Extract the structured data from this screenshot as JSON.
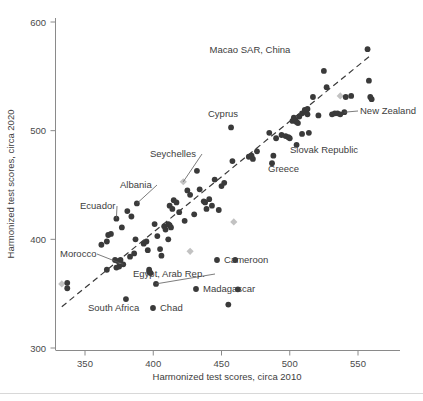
{
  "chart_data": {
    "type": "scatter",
    "title": "",
    "xlabel": "Harmonized test scores, circa 2010",
    "ylabel": "Harmonized test scores, circa 2020",
    "xlim": [
      325,
      570
    ],
    "ylim": [
      295,
      595
    ],
    "xticks": [
      350,
      400,
      450,
      500,
      550
    ],
    "yticks": [
      300,
      400,
      500,
      600
    ],
    "grid": false,
    "legend": "none",
    "trendline": {
      "type": "dashed-reference-line",
      "x": [
        333,
        560
      ],
      "y": [
        338,
        570
      ]
    },
    "series": [
      {
        "name": "Countries (highlighted dark)",
        "marker": "circle",
        "color": "#3a3a3a",
        "points": [
          {
            "x": 337,
            "y": 360
          },
          {
            "x": 337,
            "y": 355
          },
          {
            "x": 362,
            "y": 395
          },
          {
            "x": 366,
            "y": 398
          },
          {
            "x": 367,
            "y": 404
          },
          {
            "x": 369,
            "y": 405
          },
          {
            "x": 366,
            "y": 372
          },
          {
            "x": 372,
            "y": 381
          },
          {
            "x": 373,
            "y": 419
          },
          {
            "x": 374,
            "y": 380
          },
          {
            "x": 376,
            "y": 381
          },
          {
            "x": 375,
            "y": 375
          },
          {
            "x": 373,
            "y": 374
          },
          {
            "x": 377,
            "y": 411
          },
          {
            "x": 378,
            "y": 377
          },
          {
            "x": 380,
            "y": 345
          },
          {
            "x": 381,
            "y": 426
          },
          {
            "x": 383,
            "y": 384
          },
          {
            "x": 384,
            "y": 421
          },
          {
            "x": 386,
            "y": 387
          },
          {
            "x": 387,
            "y": 400
          },
          {
            "x": 388,
            "y": 433
          },
          {
            "x": 393,
            "y": 396
          },
          {
            "x": 395,
            "y": 398
          },
          {
            "x": 396,
            "y": 390
          },
          {
            "x": 397,
            "y": 372
          },
          {
            "x": 397,
            "y": 370
          },
          {
            "x": 398,
            "y": 369
          },
          {
            "x": 401,
            "y": 414
          },
          {
            "x": 402,
            "y": 359
          },
          {
            "x": 403,
            "y": 403
          },
          {
            "x": 405,
            "y": 391
          },
          {
            "x": 406,
            "y": 385
          },
          {
            "x": 408,
            "y": 412
          },
          {
            "x": 409,
            "y": 409
          },
          {
            "x": 411,
            "y": 414
          },
          {
            "x": 412,
            "y": 413
          },
          {
            "x": 413,
            "y": 411
          },
          {
            "x": 412,
            "y": 431
          },
          {
            "x": 414,
            "y": 428
          },
          {
            "x": 411,
            "y": 400
          },
          {
            "x": 415,
            "y": 436
          },
          {
            "x": 417,
            "y": 434
          },
          {
            "x": 419,
            "y": 425
          },
          {
            "x": 423,
            "y": 417
          },
          {
            "x": 425,
            "y": 445
          },
          {
            "x": 427,
            "y": 441
          },
          {
            "x": 430,
            "y": 423
          },
          {
            "x": 432,
            "y": 463
          },
          {
            "x": 434,
            "y": 446
          },
          {
            "x": 437,
            "y": 435
          },
          {
            "x": 438,
            "y": 434
          },
          {
            "x": 439,
            "y": 428
          },
          {
            "x": 441,
            "y": 437
          },
          {
            "x": 443,
            "y": 431
          },
          {
            "x": 445,
            "y": 455
          },
          {
            "x": 448,
            "y": 427
          },
          {
            "x": 450,
            "y": 449
          },
          {
            "x": 452,
            "y": 452
          },
          {
            "x": 455,
            "y": 340
          },
          {
            "x": 457,
            "y": 503
          },
          {
            "x": 458,
            "y": 472
          },
          {
            "x": 460,
            "y": 381
          },
          {
            "x": 462,
            "y": 354
          },
          {
            "x": 470,
            "y": 476
          },
          {
            "x": 472,
            "y": 477
          },
          {
            "x": 473,
            "y": 474
          },
          {
            "x": 476,
            "y": 481
          },
          {
            "x": 485,
            "y": 498
          },
          {
            "x": 487,
            "y": 470
          },
          {
            "x": 488,
            "y": 477
          },
          {
            "x": 490,
            "y": 493
          },
          {
            "x": 494,
            "y": 496
          },
          {
            "x": 497,
            "y": 495
          },
          {
            "x": 499,
            "y": 494
          },
          {
            "x": 500,
            "y": 493
          },
          {
            "x": 502,
            "y": 509
          },
          {
            "x": 503,
            "y": 512
          },
          {
            "x": 504,
            "y": 510
          },
          {
            "x": 505,
            "y": 508
          },
          {
            "x": 506,
            "y": 507
          },
          {
            "x": 505,
            "y": 487
          },
          {
            "x": 507,
            "y": 513
          },
          {
            "x": 509,
            "y": 516
          },
          {
            "x": 511,
            "y": 519
          },
          {
            "x": 512,
            "y": 517
          },
          {
            "x": 513,
            "y": 520
          },
          {
            "x": 513,
            "y": 515
          },
          {
            "x": 514,
            "y": 498
          },
          {
            "x": 509,
            "y": 497
          },
          {
            "x": 517,
            "y": 531
          },
          {
            "x": 521,
            "y": 514
          },
          {
            "x": 525,
            "y": 555
          },
          {
            "x": 527,
            "y": 540
          },
          {
            "x": 531,
            "y": 515
          },
          {
            "x": 533,
            "y": 516
          },
          {
            "x": 535,
            "y": 516
          },
          {
            "x": 537,
            "y": 515
          },
          {
            "x": 540,
            "y": 517
          },
          {
            "x": 541,
            "y": 531
          },
          {
            "x": 545,
            "y": 532
          },
          {
            "x": 557,
            "y": 575
          },
          {
            "x": 558,
            "y": 546
          },
          {
            "x": 559,
            "y": 531
          },
          {
            "x": 560,
            "y": 529
          }
        ]
      },
      {
        "name": "Countries (light gray)",
        "marker": "diamond",
        "color": "#c2c2c2",
        "points": [
          {
            "x": 333,
            "y": 359
          },
          {
            "x": 422,
            "y": 453
          },
          {
            "x": 427,
            "y": 389
          },
          {
            "x": 459,
            "y": 416
          },
          {
            "x": 537,
            "y": 532
          }
        ]
      }
    ],
    "annotations": [
      {
        "label": "Macao SAR, China",
        "text_x": 250,
        "text_y": 53,
        "point_x": 525,
        "point_y": 555,
        "leader": false,
        "anchor": "middle"
      },
      {
        "label": "New Zealand",
        "text_x": 360,
        "text_y": 114,
        "point_x": 540,
        "point_y": 517,
        "leader": true,
        "anchor": "start"
      },
      {
        "label": "Cyprus",
        "text_x": 208,
        "text_y": 117,
        "point_x": 457,
        "point_y": 503,
        "leader": false,
        "anchor": "start"
      },
      {
        "label": "Slovak Republic",
        "text_x": 290,
        "text_y": 153,
        "point_x": 505,
        "point_y": 487,
        "leader": false,
        "anchor": "start"
      },
      {
        "label": "Seychelles",
        "text_x": 150,
        "text_y": 157,
        "point_x": 422,
        "point_y": 453,
        "leader": true,
        "anchor": "start"
      },
      {
        "label": "Greece",
        "text_x": 268,
        "text_y": 172,
        "point_x": 487,
        "point_y": 470,
        "leader": false,
        "anchor": "start"
      },
      {
        "label": "Albania",
        "text_x": 120,
        "text_y": 188,
        "point_x": 388,
        "point_y": 433,
        "leader": true,
        "anchor": "start"
      },
      {
        "label": "Ecuador",
        "text_x": 80,
        "text_y": 209,
        "point_x": 373,
        "point_y": 419,
        "leader": true,
        "anchor": "start"
      },
      {
        "label": "Cameroon",
        "text_x": 224,
        "text_y": 263,
        "point_x": 460,
        "point_y": 381,
        "leader": false,
        "anchor": "start"
      },
      {
        "label": "Morocco",
        "text_x": 60,
        "text_y": 257,
        "point_x": 378,
        "point_y": 377,
        "leader": true,
        "anchor": "start"
      },
      {
        "label": "Egypt, Arab Rep.",
        "text_x": 133,
        "text_y": 277,
        "point_x": 402,
        "point_y": 359,
        "leader": true,
        "anchor": "start"
      },
      {
        "label": "Madagascar",
        "text_x": 203,
        "text_y": 292,
        "point_x": 462,
        "point_y": 354,
        "leader": false,
        "anchor": "start"
      },
      {
        "label": "South Africa",
        "text_x": 88,
        "text_y": 311,
        "point_x": 380,
        "point_y": 345,
        "leader": false,
        "anchor": "start"
      },
      {
        "label": "Chad",
        "text_x": 160,
        "text_y": 311,
        "point_x": 455,
        "point_y": 340,
        "leader": false,
        "anchor": "start"
      }
    ]
  },
  "axes": {
    "x_title": "Harmonized test scores, circa 2010",
    "y_title": "Harmonized test scores, circa 2020",
    "x_tick_labels": [
      "350",
      "400",
      "450",
      "500",
      "550"
    ],
    "y_tick_labels": [
      "600",
      "500",
      "400",
      "300"
    ]
  },
  "colors": {
    "dark_marker": "#3a3a3a",
    "gray_marker": "#c2c2c2",
    "axis": "#8a8a8a",
    "text": "#3d3d3d",
    "background": "#ffffff"
  }
}
